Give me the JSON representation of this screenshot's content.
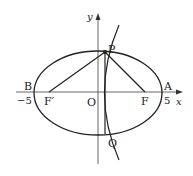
{
  "figure": {
    "axes": {
      "x_label": "x",
      "y_label": "y",
      "origin_label": "O"
    },
    "points": {
      "A": {
        "label": "A",
        "value_label": "5"
      },
      "B": {
        "label": "B",
        "value_label": "−5"
      },
      "F": {
        "label": "F"
      },
      "F_prime": {
        "label": "F′"
      },
      "P": {
        "label": "P"
      },
      "Q": {
        "label": "Q"
      }
    },
    "segments": [
      "PF′",
      "PF",
      "PQ"
    ],
    "curves": [
      "ellipse",
      "hyperbola-branch"
    ],
    "colors": {
      "stroke": "#222222",
      "axis": "#555555",
      "background": "#ffffff"
    }
  }
}
